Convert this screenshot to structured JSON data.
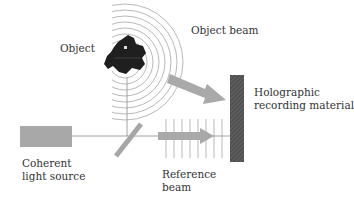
{
  "diagram": {
    "labels": {
      "object": "Object",
      "object_beam": "Object beam",
      "holographic_line1": "Holographic",
      "holographic_line2": "recording material",
      "source_line1": "Coherent",
      "source_line2": "light source",
      "reference_line1": "Reference",
      "reference_line2": "beam"
    },
    "colors": {
      "source_fill": "#a8a8a8",
      "arrow_fill": "#a9a9a9",
      "plate_fill": "#5a5a5a",
      "object_fill": "#1e1e1e",
      "line": "#888888",
      "wave": "#9a9a9a",
      "text": "#333333"
    },
    "components": [
      "coherent-light-source",
      "beam-splitter",
      "object",
      "object-wavefronts",
      "object-beam-arrow",
      "reference-wavefronts",
      "reference-beam-arrow",
      "holographic-recording-plate"
    ]
  }
}
